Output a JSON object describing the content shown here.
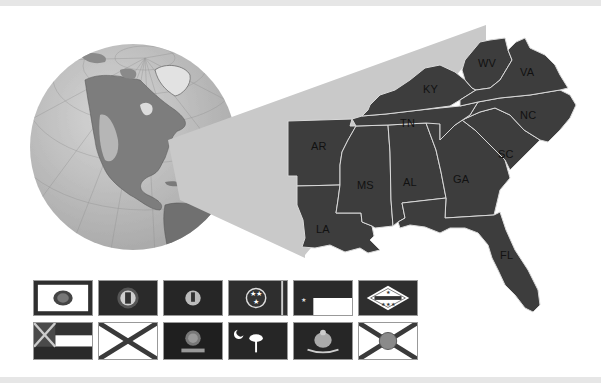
{
  "figure": {
    "title": ""
  },
  "colors": {
    "background": "#ffffff",
    "frame_bar": "#e6e6e6",
    "state_fill": "#3d3d3d",
    "state_border": "#d9d9d9",
    "wedge": "#c9c9c9",
    "globe_ocean": "#b8b8b8",
    "globe_land": "#7a7a7a",
    "label": "#111111"
  },
  "states": [
    {
      "abbr": "WV",
      "name": "West Virginia"
    },
    {
      "abbr": "VA",
      "name": "Virginia"
    },
    {
      "abbr": "KY",
      "name": "Kentucky"
    },
    {
      "abbr": "TN",
      "name": "Tennessee"
    },
    {
      "abbr": "NC",
      "name": "North Carolina"
    },
    {
      "abbr": "AR",
      "name": "Arkansas"
    },
    {
      "abbr": "SC",
      "name": "South Carolina"
    },
    {
      "abbr": "MS",
      "name": "Mississippi"
    },
    {
      "abbr": "AL",
      "name": "Alabama"
    },
    {
      "abbr": "GA",
      "name": "Georgia"
    },
    {
      "abbr": "LA",
      "name": "Louisiana"
    },
    {
      "abbr": "FL",
      "name": "Florida"
    }
  ],
  "flags": {
    "row1": [
      {
        "state": "West Virginia",
        "style": "white-field-seal"
      },
      {
        "state": "Kentucky",
        "style": "dark-field-seal"
      },
      {
        "state": "Virginia",
        "style": "dark-field-seal"
      },
      {
        "state": "Tennessee",
        "style": "three-stars-circle"
      },
      {
        "state": "North Carolina",
        "style": "stars-bars-two-stripes"
      },
      {
        "state": "Arkansas",
        "style": "diamond-stars"
      }
    ],
    "row2": [
      {
        "state": "Mississippi",
        "style": "canton-saltire-stripes"
      },
      {
        "state": "Alabama",
        "style": "saltire"
      },
      {
        "state": "Georgia",
        "style": "dark-field-seal"
      },
      {
        "state": "South Carolina",
        "style": "palmetto-crescent"
      },
      {
        "state": "Louisiana",
        "style": "pelican"
      },
      {
        "state": "Florida",
        "style": "saltire-seal"
      }
    ]
  }
}
